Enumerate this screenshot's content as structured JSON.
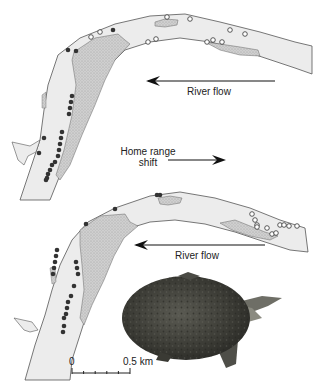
{
  "figure": {
    "panels": [
      {
        "id": "before",
        "flow_label": "River flow",
        "flow_direction": "left"
      },
      {
        "id": "after",
        "flow_label": "River flow",
        "flow_direction": "left"
      }
    ],
    "shift_label_line1": "Home range",
    "shift_label_line2": "shift",
    "shift_direction": "right",
    "scale_bar": {
      "start_label": "0",
      "end_label": "0.5 km",
      "end_value_km": 0.5,
      "minor_ticks": 5
    },
    "legend_semantics": {
      "filled_circle": "location (filled)",
      "open_circle": "location (open)"
    },
    "colors": {
      "river": "#ececec",
      "sandbar": "#c8c8c8",
      "outline": "#555555",
      "dot_filled": "#333333",
      "text": "#222222"
    }
  }
}
